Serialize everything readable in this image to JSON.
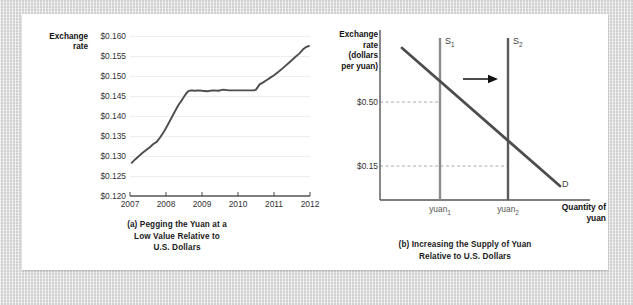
{
  "figure": {
    "background_color": "#dcdcdc",
    "panel_color": "#ffffff"
  },
  "panel_a": {
    "caption_line1": "(a) Pegging the Yuan at a",
    "caption_line2": "Low Value Relative to",
    "caption_line3": "U.S. Dollars",
    "axis_title_line1": "Exchange",
    "axis_title_line2": "rate",
    "chart_data": {
      "type": "line",
      "title": "(a) Pegging the Yuan at a Low Value Relative to U.S. Dollars",
      "xlabel": "",
      "ylabel": "Exchange rate",
      "xlim": [
        2007.0,
        2012.0
      ],
      "ylim": [
        0.12,
        0.16
      ],
      "grid": "horizontal",
      "legend": "none",
      "line_color": "#4d4d4d",
      "ytick_labels": [
        "$0.120",
        "$0.125",
        "$0.130",
        "$0.135",
        "$0.140",
        "$0.145",
        "$0.150",
        "$0.155",
        "$0.160"
      ],
      "ytick_values": [
        0.12,
        0.125,
        0.13,
        0.135,
        0.14,
        0.145,
        0.15,
        0.155,
        0.16
      ],
      "xtick_labels": [
        "2007",
        "2008",
        "2009",
        "2010",
        "2011",
        "2012"
      ],
      "xtick_values": [
        2007,
        2008,
        2009,
        2010,
        2011,
        2012
      ],
      "series": [
        {
          "name": "Dollars per yuan",
          "x": [
            2007.05,
            2007.15,
            2007.25,
            2007.35,
            2007.45,
            2007.55,
            2007.65,
            2007.75,
            2007.85,
            2007.95,
            2008.05,
            2008.15,
            2008.25,
            2008.35,
            2008.45,
            2008.55,
            2008.62,
            2008.7,
            2008.8,
            2008.9,
            2009.0,
            2009.15,
            2009.3,
            2009.45,
            2009.6,
            2009.75,
            2009.9,
            2010.0,
            2010.15,
            2010.3,
            2010.45,
            2010.5,
            2010.6,
            2010.7,
            2010.8,
            2010.9,
            2011.0,
            2011.1,
            2011.2,
            2011.3,
            2011.4,
            2011.5,
            2011.6,
            2011.7,
            2011.8,
            2011.9,
            2011.97
          ],
          "y": [
            0.1283,
            0.1292,
            0.13,
            0.1308,
            0.1315,
            0.1322,
            0.133,
            0.1336,
            0.1348,
            0.1362,
            0.1378,
            0.1395,
            0.1412,
            0.1428,
            0.1441,
            0.1455,
            0.1462,
            0.1464,
            0.1463,
            0.1464,
            0.1463,
            0.1462,
            0.1464,
            0.1463,
            0.1466,
            0.1464,
            0.1464,
            0.1464,
            0.1464,
            0.1464,
            0.1464,
            0.1466,
            0.1479,
            0.1484,
            0.149,
            0.1496,
            0.1502,
            0.1509,
            0.1516,
            0.1524,
            0.1532,
            0.154,
            0.1548,
            0.1556,
            0.1566,
            0.1573,
            0.1575
          ]
        }
      ]
    }
  },
  "panel_b": {
    "caption_line1": "(b) Increasing the Supply of Yuan",
    "caption_line2": "Relative to U.S. Dollars",
    "axis_title_line1": "Exchange",
    "axis_title_line2": "rate",
    "axis_title_line3": "(dollars",
    "axis_title_line4": "per yuan)",
    "xaxis_title_line1": "Quantity of",
    "xaxis_title_line2": "yuan",
    "chart_data": {
      "type": "line",
      "title": "(b) Increasing the Supply of Yuan Relative to U.S. Dollars",
      "xlabel": "Quantity of yuan",
      "ylabel": "Exchange rate (dollars per yuan)",
      "grid": "dashed-guides",
      "legend": "inline-labels",
      "ytick_labels": [
        "$0.50",
        "$0.15"
      ],
      "ytick_values": [
        0.5,
        0.15
      ],
      "xtick_labels": [
        "yuan₁",
        "yuan₂"
      ],
      "curves": [
        {
          "name": "S1",
          "label": "S",
          "subscript": "1",
          "type": "vertical-supply",
          "quantity_label": "yuan₁",
          "price_at_demand": 0.5,
          "color": "#8c8c8c"
        },
        {
          "name": "S2",
          "label": "S",
          "subscript": "2",
          "type": "vertical-supply",
          "quantity_label": "yuan₂",
          "price_at_demand": 0.15,
          "color": "#5a5a5a"
        },
        {
          "name": "D",
          "label": "D",
          "subscript": "",
          "type": "downward-demand",
          "color": "#4d4d4d"
        }
      ],
      "annotations": [
        {
          "name": "shift-arrow",
          "direction": "right",
          "meaning": "supply increases from S1 to S2"
        }
      ],
      "equilibria": [
        {
          "supply": "S1",
          "price": "$0.50",
          "quantity": "yuan₁"
        },
        {
          "supply": "S2",
          "price": "$0.15",
          "quantity": "yuan₂"
        }
      ]
    }
  }
}
